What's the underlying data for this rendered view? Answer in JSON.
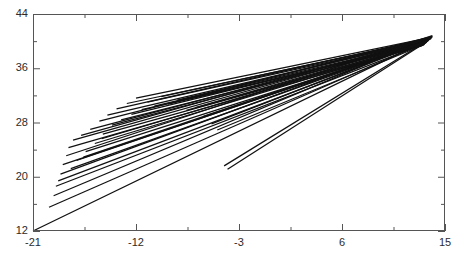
{
  "figure": {
    "background_color": "#ffffff",
    "frame_color": "#555555",
    "line_color": "#111111"
  },
  "chart_data": {
    "type": "line",
    "title": "",
    "subtitle": "",
    "xlabel": "",
    "ylabel": "",
    "xlim": [
      -21,
      15
    ],
    "ylim": [
      12,
      44
    ],
    "grid": false,
    "legend": null,
    "legend_position": "none",
    "x_major_ticks": [
      -21,
      -12,
      -3,
      6,
      15
    ],
    "x_major_tick_labels": [
      "-21",
      "-12",
      "-3",
      "6",
      "15"
    ],
    "x_minor_ticks": [
      -16.5,
      -7.5,
      1.5,
      10.5
    ],
    "y_major_ticks": [
      12,
      20,
      28,
      36,
      44
    ],
    "y_major_tick_labels": [
      "12",
      "20",
      "28",
      "36",
      "44"
    ],
    "y_minor_ticks": [
      16,
      24,
      32,
      40
    ],
    "series": [
      {
        "name": "line-01",
        "x": [
          -21.0,
          13.6
        ],
        "y": [
          12.0,
          40.3
        ]
      },
      {
        "name": "line-02",
        "x": [
          -19.6,
          13.4
        ],
        "y": [
          15.5,
          39.9
        ]
      },
      {
        "name": "line-03",
        "x": [
          -19.2,
          13.8
        ],
        "y": [
          17.2,
          40.6
        ]
      },
      {
        "name": "line-04",
        "x": [
          -19.0,
          13.2
        ],
        "y": [
          18.6,
          39.6
        ]
      },
      {
        "name": "line-05",
        "x": [
          -18.6,
          13.7
        ],
        "y": [
          20.4,
          40.4
        ]
      },
      {
        "name": "line-06",
        "x": [
          -18.4,
          13.3
        ],
        "y": [
          21.8,
          39.8
        ]
      },
      {
        "name": "line-07",
        "x": [
          -18.1,
          13.9
        ],
        "y": [
          23.1,
          40.8
        ]
      },
      {
        "name": "line-08",
        "x": [
          -17.9,
          13.1
        ],
        "y": [
          24.3,
          39.4
        ]
      },
      {
        "name": "line-09",
        "x": [
          -17.5,
          13.6
        ],
        "y": [
          25.4,
          40.2
        ]
      },
      {
        "name": "line-10",
        "x": [
          -17.2,
          13.4
        ],
        "y": [
          22.4,
          39.9
        ]
      },
      {
        "name": "line-11",
        "x": [
          -16.8,
          13.8
        ],
        "y": [
          26.1,
          40.5
        ]
      },
      {
        "name": "line-12",
        "x": [
          -16.4,
          13.2
        ],
        "y": [
          23.7,
          39.6
        ]
      },
      {
        "name": "line-13",
        "x": [
          -16.0,
          13.7
        ],
        "y": [
          27.0,
          40.3
        ]
      },
      {
        "name": "line-14",
        "x": [
          -15.6,
          13.3
        ],
        "y": [
          24.9,
          39.7
        ]
      },
      {
        "name": "line-15",
        "x": [
          -15.2,
          13.9
        ],
        "y": [
          28.2,
          40.7
        ]
      },
      {
        "name": "line-16",
        "x": [
          -14.9,
          13.1
        ],
        "y": [
          26.3,
          39.4
        ]
      },
      {
        "name": "line-17",
        "x": [
          -14.5,
          13.6
        ],
        "y": [
          29.1,
          40.2
        ]
      },
      {
        "name": "line-18",
        "x": [
          -14.1,
          13.4
        ],
        "y": [
          27.6,
          39.9
        ]
      },
      {
        "name": "line-19",
        "x": [
          -13.7,
          13.8
        ],
        "y": [
          30.0,
          40.5
        ]
      },
      {
        "name": "line-20",
        "x": [
          -13.3,
          13.2
        ],
        "y": [
          28.4,
          39.6
        ]
      },
      {
        "name": "line-21",
        "x": [
          -12.8,
          13.7
        ],
        "y": [
          30.8,
          40.3
        ]
      },
      {
        "name": "line-22",
        "x": [
          -12.4,
          13.3
        ],
        "y": [
          29.2,
          39.8
        ]
      },
      {
        "name": "line-23",
        "x": [
          -12.0,
          13.9
        ],
        "y": [
          31.6,
          40.6
        ]
      },
      {
        "name": "line-24",
        "x": [
          -11.5,
          13.1
        ],
        "y": [
          29.9,
          39.5
        ]
      },
      {
        "name": "line-25",
        "x": [
          -11.0,
          13.6
        ],
        "y": [
          31.0,
          40.2
        ]
      },
      {
        "name": "line-26",
        "x": [
          -10.4,
          13.4
        ],
        "y": [
          30.4,
          39.9
        ]
      },
      {
        "name": "line-27",
        "x": [
          -9.8,
          13.8
        ],
        "y": [
          31.8,
          40.4
        ]
      },
      {
        "name": "line-28",
        "x": [
          -9.2,
          13.2
        ],
        "y": [
          30.7,
          39.6
        ]
      },
      {
        "name": "line-29",
        "x": [
          -8.4,
          13.7
        ],
        "y": [
          31.3,
          40.3
        ]
      },
      {
        "name": "line-30",
        "x": [
          -7.6,
          13.3
        ],
        "y": [
          29.8,
          39.7
        ]
      },
      {
        "name": "line-31",
        "x": [
          -6.8,
          13.6
        ],
        "y": [
          30.2,
          40.1
        ]
      },
      {
        "name": "line-32",
        "x": [
          -6.1,
          13.4
        ],
        "y": [
          28.9,
          39.8
        ]
      },
      {
        "name": "line-33",
        "x": [
          -5.4,
          13.8
        ],
        "y": [
          27.8,
          40.4
        ]
      },
      {
        "name": "line-34",
        "x": [
          -4.9,
          13.2
        ],
        "y": [
          26.9,
          39.5
        ]
      },
      {
        "name": "line-35",
        "x": [
          -4.3,
          13.6
        ],
        "y": [
          21.6,
          40.2
        ]
      },
      {
        "name": "line-36",
        "x": [
          -4.0,
          13.4
        ],
        "y": [
          21.1,
          39.9
        ]
      },
      {
        "name": "line-37",
        "x": [
          -18.8,
          13.5
        ],
        "y": [
          19.4,
          40.0
        ]
      },
      {
        "name": "line-38",
        "x": [
          -17.7,
          13.45
        ],
        "y": [
          21.2,
          39.95
        ]
      },
      {
        "name": "line-39",
        "x": [
          -16.6,
          13.55
        ],
        "y": [
          22.9,
          40.1
        ]
      },
      {
        "name": "line-40",
        "x": [
          -15.0,
          13.35
        ],
        "y": [
          25.6,
          39.85
        ]
      }
    ]
  }
}
